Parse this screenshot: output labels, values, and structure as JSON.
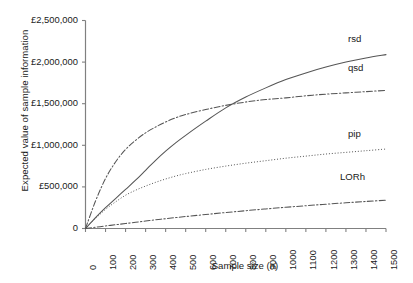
{
  "chart_data": {
    "type": "line",
    "title": "",
    "xlabel": "Sample size (n)",
    "ylabel": "Expected value of sample information",
    "xlim": [
      0,
      1500
    ],
    "ylim": [
      0,
      2500000
    ],
    "grid": false,
    "legend_position": "line-end-labels",
    "xticks": [
      "0",
      "100",
      "200",
      "300",
      "400",
      "500",
      "600",
      "700",
      "800",
      "900",
      "1000",
      "1100",
      "1200",
      "1300",
      "1400",
      "1500"
    ],
    "xtick_values": [
      0,
      100,
      200,
      300,
      400,
      500,
      600,
      700,
      800,
      900,
      1000,
      1100,
      1200,
      1300,
      1400,
      1500
    ],
    "yticks": [
      "0",
      "£500,000",
      "£1,000,000",
      "£1,500,000",
      "£2,000,000",
      "£2,500,000"
    ],
    "ytick_values": [
      0,
      500000,
      1000000,
      1500000,
      2000000,
      2500000
    ],
    "x": [
      0,
      50,
      100,
      150,
      200,
      250,
      300,
      350,
      400,
      450,
      500,
      600,
      700,
      800,
      900,
      1000,
      1100,
      1200,
      1300,
      1400,
      1500
    ],
    "series": [
      {
        "name": "rsd",
        "label": "rsd",
        "style": "solid",
        "color": "#555555",
        "values": [
          0,
          130000,
          250000,
          360000,
          470000,
          580000,
          700000,
          820000,
          930000,
          1030000,
          1120000,
          1290000,
          1450000,
          1580000,
          1690000,
          1790000,
          1870000,
          1940000,
          2000000,
          2050000,
          2090000
        ]
      },
      {
        "name": "qsd",
        "label": "qsd",
        "style": "dashdot",
        "color": "#555555",
        "values": [
          0,
          330000,
          600000,
          800000,
          950000,
          1060000,
          1150000,
          1220000,
          1280000,
          1330000,
          1370000,
          1430000,
          1480000,
          1520000,
          1550000,
          1570000,
          1595000,
          1615000,
          1630000,
          1645000,
          1660000
        ]
      },
      {
        "name": "pip",
        "label": "pip",
        "style": "dotted",
        "color": "#555555",
        "values": [
          0,
          120000,
          230000,
          320000,
          400000,
          460000,
          510000,
          555000,
          595000,
          630000,
          660000,
          710000,
          750000,
          785000,
          815000,
          845000,
          870000,
          895000,
          915000,
          935000,
          955000
        ]
      },
      {
        "name": "LORh",
        "label": "LORh",
        "style": "dashdot",
        "color": "#555555",
        "values": [
          0,
          15000,
          30000,
          45000,
          60000,
          75000,
          90000,
          105000,
          118000,
          131000,
          144000,
          168000,
          192000,
          214000,
          235000,
          255000,
          274000,
          292000,
          309000,
          325000,
          340000
        ]
      }
    ],
    "series_label_positions": [
      {
        "name": "rsd",
        "x": 1400,
        "y": 2280000
      },
      {
        "name": "qsd",
        "x": 1400,
        "y": 1930000
      },
      {
        "name": "pip",
        "x": 1400,
        "y": 1140000
      },
      {
        "name": "LORh",
        "x": 1360,
        "y": 620000
      }
    ],
    "axis_color": "#808080"
  }
}
